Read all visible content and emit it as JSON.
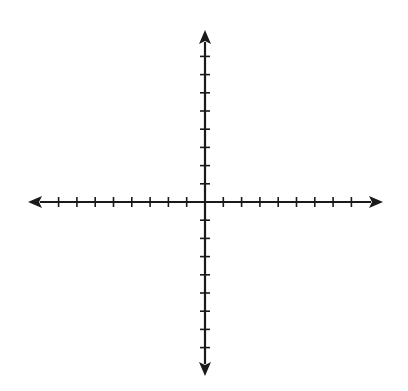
{
  "diagram": {
    "type": "cartesian-coordinate-plane",
    "stroke_color": "#1a1a1a",
    "background_color": "#ffffff",
    "origin": {
      "x": 205,
      "y": 202
    },
    "x_axis": {
      "left_tip": 28,
      "right_tip": 383,
      "ticks_negative": 8,
      "ticks_positive": 8,
      "tick_spacing": 18.3,
      "labels": []
    },
    "y_axis": {
      "top_tip": 30,
      "bottom_tip": 376,
      "ticks_positive": 8,
      "ticks_negative": 8,
      "tick_spacing": 18.2,
      "labels": []
    }
  }
}
